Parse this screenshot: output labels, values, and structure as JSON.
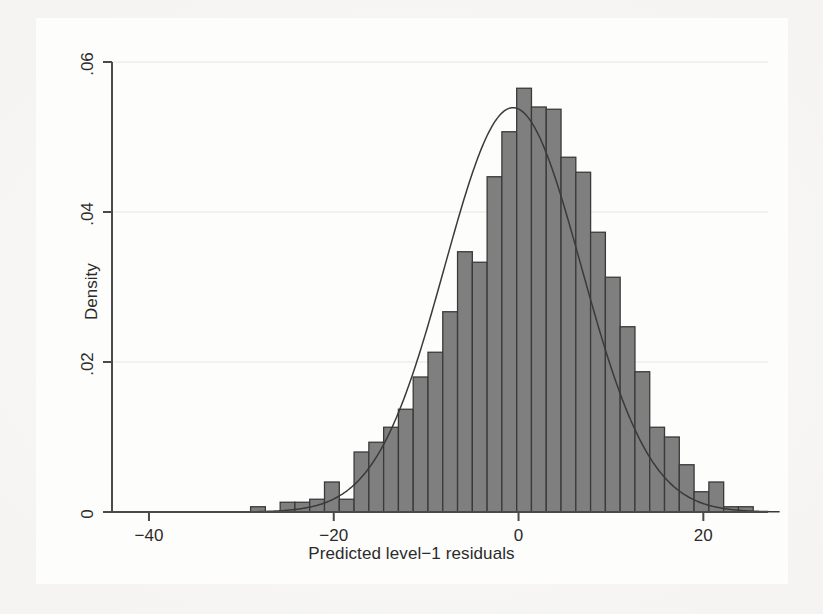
{
  "figure": {
    "background_color": "#f2f1ef",
    "panel_color": "#fdfdfc",
    "bar_fill": "#7f7f7f",
    "bar_stroke": "#3a3a3a",
    "curve_color": "#3a3a3a",
    "axis_color": "#4a4a4a",
    "grid_color": "#e8e6e2",
    "text_color": "#2b2b2b"
  },
  "chart_data": {
    "type": "bar",
    "subtype": "histogram-with-normal-overlay",
    "title": "",
    "subtitle": "",
    "xlabel": "Predicted level−1 residuals",
    "ylabel": "Density",
    "xlim": [
      -44,
      27
    ],
    "ylim": [
      0,
      0.06
    ],
    "xticks": [
      -40,
      -20,
      0,
      20
    ],
    "xtick_labels": [
      "−40",
      "−20",
      "0",
      "20"
    ],
    "yticks": [
      0,
      0.02,
      0.04,
      0.06
    ],
    "ytick_labels": [
      "0",
      ".02",
      ".04",
      ".06"
    ],
    "grid": "horizontal",
    "legend": null,
    "bin_width": 1.6,
    "bin_left_edges": [
      -29.0,
      -27.4,
      -25.8,
      -24.2,
      -22.6,
      -21.0,
      -19.4,
      -17.8,
      -16.2,
      -14.6,
      -13.0,
      -11.4,
      -9.8,
      -8.2,
      -6.6,
      -5.0,
      -3.4,
      -1.8,
      -0.2,
      1.4,
      3.0,
      4.6,
      6.2,
      7.8,
      9.4,
      11.0,
      12.6,
      14.2,
      15.8,
      17.4,
      19.0,
      20.6,
      22.2,
      23.8
    ],
    "bin_centers": [
      -28.2,
      -26.6,
      -25.0,
      -23.4,
      -21.8,
      -20.2,
      -18.6,
      -17.0,
      -15.4,
      -13.8,
      -12.2,
      -10.6,
      -9.0,
      -7.4,
      -5.8,
      -4.2,
      -2.6,
      -1.0,
      0.6,
      2.2,
      3.8,
      5.4,
      7.0,
      8.6,
      10.2,
      11.8,
      13.4,
      15.0,
      16.6,
      18.2,
      19.8,
      21.4,
      23.0,
      24.6
    ],
    "values": [
      0.0007,
      0.0,
      0.0013,
      0.0013,
      0.0017,
      0.004,
      0.0017,
      0.008,
      0.0093,
      0.0113,
      0.0137,
      0.018,
      0.0213,
      0.0267,
      0.0347,
      0.0333,
      0.0447,
      0.0507,
      0.0565,
      0.054,
      0.0537,
      0.0473,
      0.0453,
      0.0373,
      0.0313,
      0.0247,
      0.0187,
      0.0113,
      0.01,
      0.0063,
      0.0027,
      0.004,
      0.0007,
      0.0007
    ],
    "series": [
      {
        "name": "Histogram (Density)",
        "type": "bar",
        "values": [
          0.0007,
          0.0,
          0.0013,
          0.0013,
          0.0017,
          0.004,
          0.0017,
          0.008,
          0.0093,
          0.0113,
          0.0137,
          0.018,
          0.0213,
          0.0267,
          0.0347,
          0.0333,
          0.0447,
          0.0507,
          0.0565,
          0.054,
          0.0537,
          0.0473,
          0.0453,
          0.0373,
          0.0313,
          0.0247,
          0.0187,
          0.0113,
          0.01,
          0.0063,
          0.0027,
          0.004,
          0.0007,
          0.0007
        ]
      },
      {
        "name": "Normal density overlay",
        "type": "line",
        "distribution": "normal",
        "mean": -0.6,
        "sd": 7.4,
        "peak_density": 0.0539
      }
    ],
    "annotations": []
  }
}
